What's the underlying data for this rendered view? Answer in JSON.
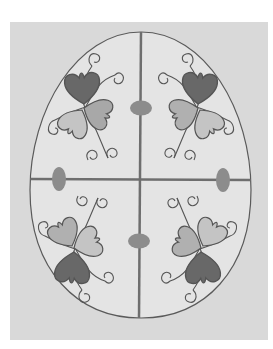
{
  "illustration": {
    "title": "Decorated egg with heart-petal flower motifs",
    "colors": {
      "background": "#ffffff",
      "panel": "#d9d9d9",
      "egg_fill": "#e4e4e4",
      "outline": "#5a5a5a",
      "divider": "#6e6e6e",
      "oval": "#8c8c8c",
      "petal_dark": "#686868",
      "petal_mid": "#a8a8a8",
      "petal_light": "#c4c4c4"
    },
    "quadrants": [
      "top-left",
      "top-right",
      "bottom-left",
      "bottom-right"
    ],
    "ovals": [
      {
        "name": "top-center",
        "cx": 141,
        "cy": 108
      },
      {
        "name": "bottom-center",
        "cx": 139,
        "cy": 241
      },
      {
        "name": "left",
        "cx": 59,
        "cy": 179
      },
      {
        "name": "right",
        "cx": 223,
        "cy": 179
      }
    ]
  }
}
